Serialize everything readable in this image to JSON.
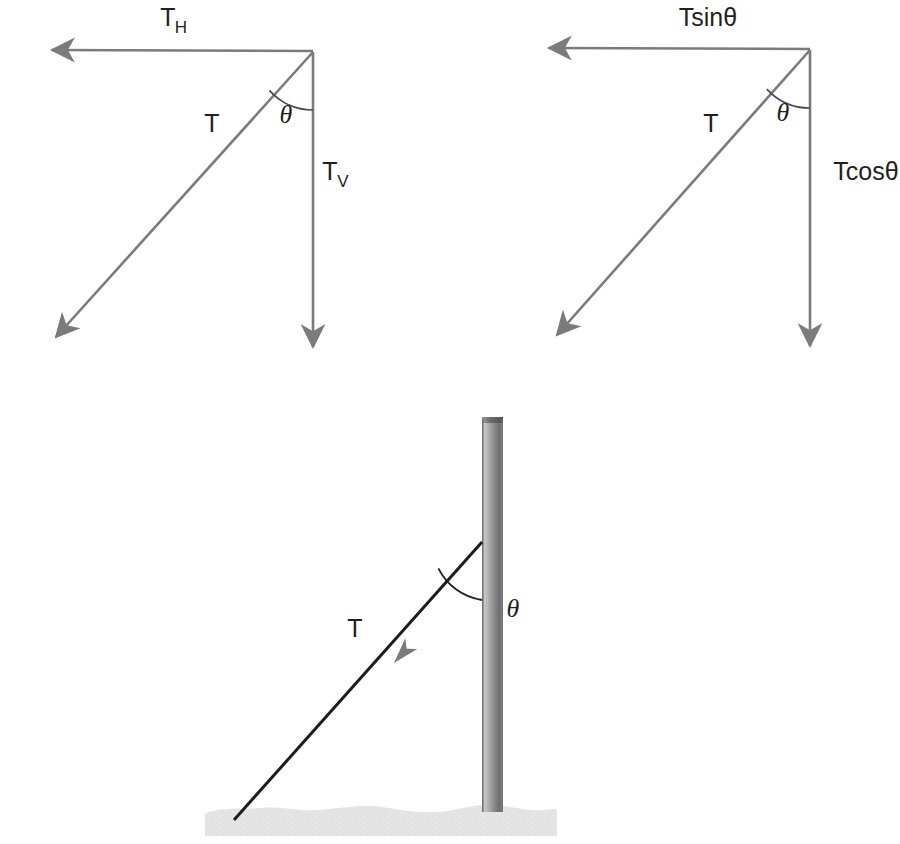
{
  "figure": {
    "colors": {
      "vector_gray": "#7b7b7b",
      "wire_black": "#1a1a1a",
      "arrowhead_gray": "#7b7b7b",
      "ground_gray": "#e2e2e2",
      "pole_light": "#b9b9b9",
      "pole_dark": "#6d6d6d",
      "text_black": "#231f20",
      "background": "#ffffff"
    }
  },
  "panels": [
    {
      "id": "left-vector-triangle",
      "name": "generic-component-triangle",
      "labels": {
        "horizontal": "T",
        "horizontal_sub": "H",
        "hypotenuse": "T",
        "angle": "θ",
        "vertical": "T",
        "vertical_sub": "V"
      },
      "geometry": {
        "apex": [
          313,
          52
        ],
        "horizontal_tip": [
          42,
          50
        ],
        "vertical_tip": [
          313,
          356
        ],
        "diagonal_tip": [
          47,
          345
        ],
        "angle_arc_radius": 58,
        "angle_degrees": 42
      },
      "label_positions": {
        "horizontal": [
          168,
          26
        ],
        "hypotenuse": [
          212,
          132
        ],
        "angle": [
          286,
          120
        ],
        "vertical": [
          320,
          180
        ]
      }
    },
    {
      "id": "right-vector-triangle",
      "name": "trig-component-triangle",
      "labels": {
        "horizontal": "Tsinθ",
        "hypotenuse": "T",
        "angle": "θ",
        "vertical": "Tcosθ"
      },
      "geometry": {
        "apex": [
          810,
          50
        ],
        "horizontal_tip": [
          538,
          48
        ],
        "vertical_tip": [
          810,
          355
        ],
        "diagonal_tip": [
          548,
          343
        ],
        "angle_arc_radius": 58,
        "angle_degrees": 42
      },
      "label_positions": {
        "horizontal": [
          653,
          26
        ],
        "hypotenuse": [
          711,
          132
        ],
        "angle": [
          783,
          120
        ],
        "vertical": [
          819,
          180
        ]
      }
    },
    {
      "id": "pole-scene",
      "name": "guy-wire-pole-scene",
      "labels": {
        "tension": "T",
        "angle": "θ"
      },
      "geometry": {
        "pole_left": 482,
        "pole_right": 503,
        "pole_top": 417,
        "pole_bottom": 822,
        "wire_anchor_pole": [
          482,
          542
        ],
        "wire_anchor_ground": [
          234,
          820
        ],
        "wire_arrow_at": [
          394,
          663
        ],
        "angle_arc_radius": 58,
        "ground_left": 205,
        "ground_right": 557,
        "ground_top": 806,
        "ground_bottom": 836
      },
      "label_positions": {
        "tension": [
          355,
          628
        ],
        "angle": [
          513,
          608
        ]
      }
    }
  ]
}
